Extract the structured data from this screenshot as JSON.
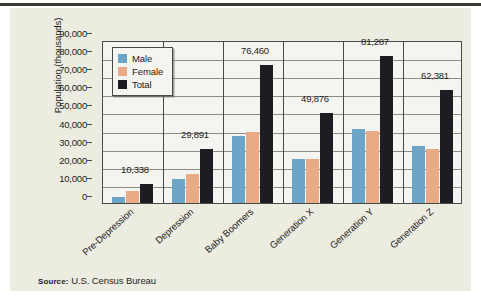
{
  "chart_data": {
    "type": "bar",
    "title": "",
    "xlabel": "",
    "ylabel": "Population (thousands)",
    "ylim": [
      0,
      90000
    ],
    "ytick_labels": [
      "90,000",
      "80,000",
      "70,000",
      "60,000",
      "50,000",
      "40,000",
      "30,000",
      "20,000",
      "10,000",
      "0"
    ],
    "ytick_values": [
      90000,
      80000,
      70000,
      60000,
      50000,
      40000,
      30000,
      20000,
      10000,
      0
    ],
    "grid": true,
    "legend_position": "upper-left-inside",
    "categories": [
      "Pre-Depression",
      "Depression",
      "Baby Boomers",
      "Generation X",
      "Generation Y",
      "Generation Z"
    ],
    "series": [
      {
        "name": "Male",
        "color": "#6ca5c6",
        "values": [
          3400,
          13400,
          37000,
          24300,
          41000,
          31500
        ]
      },
      {
        "name": "Female",
        "color": "#e8ab86",
        "values": [
          6900,
          15800,
          39200,
          24200,
          39500,
          29900
        ]
      },
      {
        "name": "Total",
        "color": "#1c1c22",
        "values": [
          10338,
          29891,
          76460,
          49876,
          81287,
          62381
        ]
      }
    ],
    "data_labels": [
      "10,338",
      "29,891",
      "76,460",
      "49,876",
      "81,287",
      "62,381"
    ],
    "data_labels_series": "Total"
  },
  "legend": {
    "items": [
      {
        "label": "Male",
        "color": "#6ca5c6"
      },
      {
        "label": "Female",
        "color": "#e8ab86"
      },
      {
        "label": "Total",
        "color": "#1c1c22"
      }
    ]
  },
  "source": {
    "label": "Source:",
    "text": "U.S. Census Bureau"
  },
  "colors": {
    "panel_background": "#ecece0",
    "plot_background": "#f4f4f0",
    "axis": "#4a4a44",
    "gridline": "#8d8d86",
    "text": "#1d1d1d",
    "top_rule": "#3a3a34"
  }
}
